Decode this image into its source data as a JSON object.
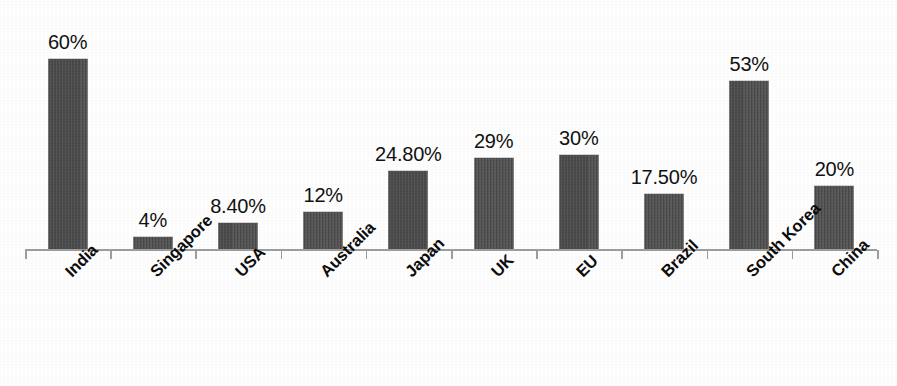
{
  "chart_data": {
    "type": "bar",
    "title": "",
    "subtitle": "",
    "xlabel": "",
    "ylabel": "",
    "grid": false,
    "legend": false,
    "ylim": [
      0,
      60
    ],
    "categories": [
      "India",
      "Singapore",
      "USA",
      "Australia",
      "Japan",
      "UK",
      "EU",
      "Brazil",
      "South Korea",
      "China"
    ],
    "values": [
      60,
      4,
      8.4,
      12,
      24.8,
      29,
      30,
      17.5,
      53,
      20
    ],
    "value_labels": [
      "60%",
      "4%",
      "8.40%",
      "12%",
      "24.80%",
      "29%",
      "30%",
      "17.50%",
      "53%",
      "20%"
    ],
    "series": [
      {
        "name": "",
        "values": [
          60,
          4,
          8.4,
          12,
          24.8,
          29,
          30,
          17.5,
          53,
          20
        ]
      }
    ],
    "bar_color": "#4c4c4c",
    "axis_color": "#9e9e9e",
    "label_color": "#121212",
    "background_color": "#ffffff"
  },
  "axis": {
    "tick_count": 11
  }
}
